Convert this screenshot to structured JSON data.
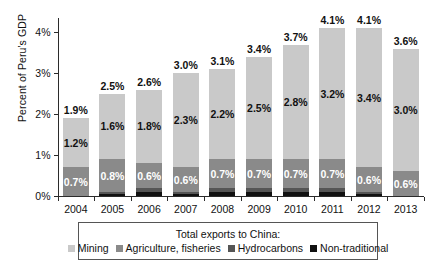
{
  "chart_data": {
    "type": "bar",
    "subtype": "stacked-bar",
    "title": "",
    "xlabel": "",
    "ylabel": "Percent of Peru's GDP",
    "categories": [
      "2004",
      "2005",
      "2006",
      "2007",
      "2008",
      "2009",
      "2010",
      "2011",
      "2012",
      "2013"
    ],
    "ylim": [
      0,
      4.35
    ],
    "ytick_values": [
      0,
      1,
      2,
      3,
      4
    ],
    "ytick_labels": [
      "0%",
      "1%",
      "2%",
      "3%",
      "4%"
    ],
    "grid": false,
    "legend_position": "bottom",
    "legend_title": "Total exports to China:",
    "series": [
      {
        "name": "Mining",
        "color": "#c9c9c9",
        "values": [
          1.2,
          1.6,
          1.8,
          2.3,
          2.2,
          2.5,
          2.8,
          3.2,
          3.4,
          3.0
        ],
        "labels": [
          "1.2%",
          "1.6%",
          "1.8%",
          "2.3%",
          "2.2%",
          "2.5%",
          "2.8%",
          "3.2%",
          "3.4%",
          "3.0%"
        ]
      },
      {
        "name": "Agriculture, fisheries",
        "color": "#8a8a8a",
        "values": [
          0.7,
          0.8,
          0.6,
          0.6,
          0.7,
          0.7,
          0.7,
          0.7,
          0.6,
          0.6
        ],
        "labels": [
          "0.7%",
          "0.8%",
          "0.6%",
          "0.6%",
          "0.7%",
          "0.7%",
          "0.7%",
          "0.7%",
          "0.6%",
          "0.6%"
        ]
      },
      {
        "name": "Hydrocarbons",
        "color": "#555555",
        "values": [
          0.0,
          0.05,
          0.1,
          0.05,
          0.1,
          0.1,
          0.1,
          0.1,
          0.05,
          0.0
        ],
        "labels": [
          "",
          "",
          "",
          "",
          "",
          "",
          "",
          "",
          "",
          ""
        ]
      },
      {
        "name": "Non-traditional",
        "color": "#111111",
        "values": [
          0.0,
          0.05,
          0.1,
          0.05,
          0.1,
          0.1,
          0.1,
          0.1,
          0.05,
          0.0
        ],
        "labels": [
          "",
          "",
          "",
          "",
          "",
          "",
          "",
          "",
          "",
          ""
        ]
      }
    ],
    "totals": [
      1.9,
      2.5,
      2.6,
      3.0,
      3.1,
      3.4,
      3.7,
      4.1,
      4.1,
      3.6
    ],
    "total_labels": [
      "1.9%",
      "2.5%",
      "2.6%",
      "3.0%",
      "3.1%",
      "3.4%",
      "3.7%",
      "4.1%",
      "4.1%",
      "3.6%"
    ]
  },
  "axis": {
    "y_title": "Percent of Peru's GDP"
  },
  "legend": {
    "title": "Total exports to China:",
    "items": [
      {
        "label": "Mining",
        "color": "#c9c9c9"
      },
      {
        "label": "Agriculture, fisheries",
        "color": "#8a8a8a"
      },
      {
        "label": "Hydrocarbons",
        "color": "#555555"
      },
      {
        "label": "Non-traditional",
        "color": "#111111"
      }
    ]
  }
}
